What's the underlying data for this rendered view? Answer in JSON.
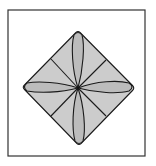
{
  "diagram": {
    "type": "origami-fold",
    "colors": {
      "background": "#ffffff",
      "frame": "#333333",
      "diamond_fill": "#cccccc",
      "petal_fill": "#bcbcbc",
      "line": "#1a1a1a"
    },
    "frame": {
      "x": 8,
      "y": 10,
      "width": 137,
      "height": 146
    },
    "diamond": {
      "top": [
        78,
        31
      ],
      "right": [
        134,
        88
      ],
      "bottom": [
        79,
        145
      ],
      "left": [
        23,
        87
      ],
      "center": [
        78,
        88
      ]
    },
    "creases": [
      {
        "name": "upper-left",
        "to": [
          51,
          59
        ]
      },
      {
        "name": "upper-right",
        "to": [
          106,
          60
        ]
      },
      {
        "name": "lower-left",
        "to": [
          51,
          116
        ]
      },
      {
        "name": "lower-right",
        "to": [
          106,
          116
        ]
      }
    ],
    "petals": [
      "top",
      "right",
      "bottom",
      "left"
    ]
  }
}
